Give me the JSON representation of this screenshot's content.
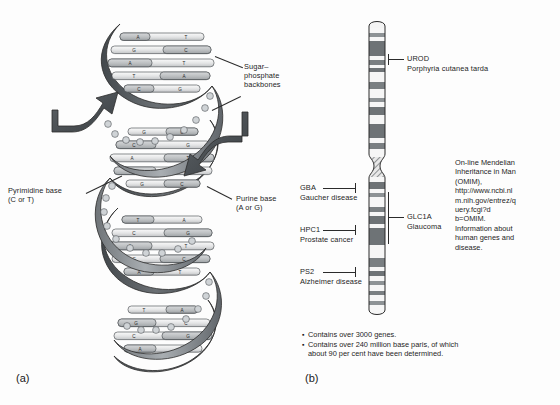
{
  "figure": {
    "panel_a_letter": "(a)",
    "panel_b_letter": "(b)"
  },
  "dna_diagram": {
    "labels": {
      "sugar_phosphate": "Sugar–\nphosphate\nbackbones",
      "pyrimidine": "Pyrimidine base\n(C or T)",
      "purine": "Purine base\n(A or G)"
    },
    "base_letters": [
      "A",
      "T",
      "G",
      "C",
      "C",
      "G",
      "T",
      "A"
    ],
    "rungs": [
      {
        "left": "A",
        "right": "T"
      },
      {
        "left": "G",
        "right": "C"
      },
      {
        "left": "A",
        "right": "T"
      },
      {
        "left": "T",
        "right": "A"
      },
      {
        "left": "C",
        "right": "G"
      },
      {
        "left": "G",
        "right": "C"
      },
      {
        "left": "C",
        "right": "G"
      },
      {
        "left": "A",
        "right": "T"
      },
      {
        "left": "T",
        "right": "A"
      },
      {
        "left": "G",
        "right": "C"
      },
      {
        "left": "A",
        "right": "T"
      },
      {
        "left": "C",
        "right": "G"
      },
      {
        "left": "T",
        "right": "A"
      },
      {
        "left": "G",
        "right": "C"
      },
      {
        "left": "A",
        "right": "T"
      }
    ]
  },
  "chromosome_diagram": {
    "gene_markers_left": [
      {
        "gene": "GBA",
        "disease": "Gaucher disease"
      },
      {
        "gene": "HPC1",
        "disease": "Prostate cancer"
      },
      {
        "gene": "PS2",
        "disease": "Alzheimer disease"
      }
    ],
    "gene_markers_right": [
      {
        "gene": "UROD",
        "disease": "Porphyria cutanea tarda"
      },
      {
        "gene": "GLC1A",
        "disease": "Glaucoma"
      }
    ],
    "omim_note": "On-line Mendelian Inheritance in Man (OMIM), http://www.ncbi.nlm.nih.gov/entrez/query.fcgi?d b=OMIM. Information about human genes and disease.",
    "facts": [
      "Contains over 3000 genes.",
      "Contains over 240 million base paris, of which\nabout 90 per cent have been determined."
    ],
    "bullet_glyph": "▪"
  },
  "colors": {
    "backbone_dark": "#55595c",
    "backbone_mid": "#8a8f93",
    "backbone_light": "#b9bdc0",
    "base_light": "#e9e9e9",
    "base_mid": "#c9cbcd",
    "band_dark": "#6e7376",
    "band_light": "#f2f2f2",
    "outline": "#2b2b2b",
    "text": "#1d1d1d"
  }
}
